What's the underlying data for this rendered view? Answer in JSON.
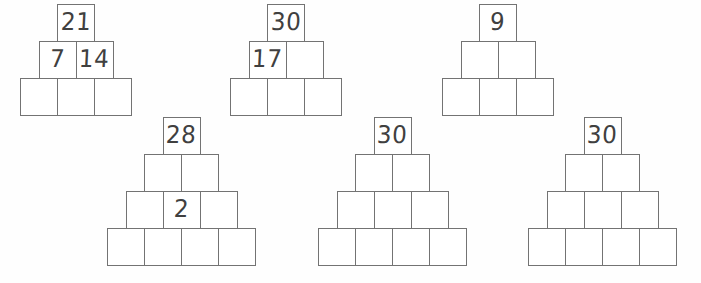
{
  "page": {
    "background_color": "#fefefe",
    "cell_border_color": "#737373",
    "digit_color": "#404040",
    "cell_size_px": 38
  },
  "pyramids": [
    {
      "name": "pyramid-1",
      "left": 20,
      "top": 5,
      "rows": [
        {
          "cells": [
            "21"
          ]
        },
        {
          "cells": [
            "7",
            "14"
          ]
        },
        {
          "cells": [
            "",
            "",
            ""
          ]
        }
      ]
    },
    {
      "name": "pyramid-2",
      "left": 230,
      "top": 5,
      "rows": [
        {
          "cells": [
            "30"
          ]
        },
        {
          "cells": [
            "17",
            ""
          ]
        },
        {
          "cells": [
            "",
            "",
            ""
          ]
        }
      ]
    },
    {
      "name": "pyramid-3",
      "left": 442,
      "top": 5,
      "rows": [
        {
          "cells": [
            "9"
          ]
        },
        {
          "cells": [
            "",
            ""
          ]
        },
        {
          "cells": [
            "",
            "",
            ""
          ]
        }
      ]
    },
    {
      "name": "pyramid-4",
      "left": 107,
      "top": 118,
      "rows": [
        {
          "cells": [
            "28"
          ]
        },
        {
          "cells": [
            "",
            ""
          ]
        },
        {
          "cells": [
            "",
            "2",
            ""
          ]
        },
        {
          "cells": [
            "",
            "",
            "",
            ""
          ]
        }
      ]
    },
    {
      "name": "pyramid-5",
      "left": 318,
      "top": 118,
      "rows": [
        {
          "cells": [
            "30"
          ]
        },
        {
          "cells": [
            "",
            ""
          ]
        },
        {
          "cells": [
            "",
            "",
            ""
          ]
        },
        {
          "cells": [
            "",
            "",
            "",
            ""
          ]
        }
      ]
    },
    {
      "name": "pyramid-6",
      "left": 528,
      "top": 118,
      "rows": [
        {
          "cells": [
            "30"
          ]
        },
        {
          "cells": [
            "",
            ""
          ]
        },
        {
          "cells": [
            "",
            "",
            ""
          ]
        },
        {
          "cells": [
            "",
            "",
            "",
            ""
          ]
        }
      ]
    }
  ]
}
